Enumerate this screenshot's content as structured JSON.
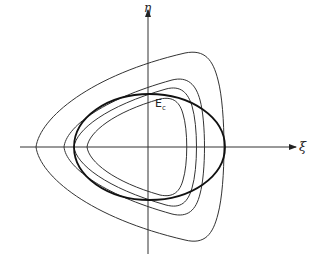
{
  "figure": {
    "axes": {
      "x_label": "ξ",
      "y_label": "η"
    },
    "curve_label": {
      "main": "E",
      "subscript": "c"
    },
    "curves": [
      {
        "name": "outer-contour",
        "type": "rounded-triangle",
        "stroke": "#333333",
        "weight": "thin"
      },
      {
        "name": "contour-2",
        "type": "rounded-triangle",
        "stroke": "#333333",
        "weight": "thin"
      },
      {
        "name": "contour-3",
        "type": "rounded-triangle",
        "stroke": "#333333",
        "weight": "thin"
      },
      {
        "name": "inner-contour",
        "type": "rounded-triangle",
        "stroke": "#333333",
        "weight": "thin"
      },
      {
        "name": "critical-ellipse-Ec",
        "type": "ellipse",
        "stroke": "#111111",
        "weight": "thick"
      }
    ],
    "colors": {
      "background": "#ffffff",
      "line": "#333333",
      "ellipse": "#111111"
    }
  }
}
